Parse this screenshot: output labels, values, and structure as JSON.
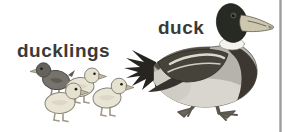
{
  "card": {
    "background": "#ffffff"
  },
  "labels": {
    "ducklings": "ducklings",
    "duck": "duck"
  },
  "colors": {
    "label_text": "#3a3a3a",
    "edge_bar": "#a0a0a0",
    "duck_head": "#262a22",
    "duck_chest": "#3c3831",
    "duck_belly": "#d8d6ce",
    "duck_wing": "#46433b",
    "duck_bill": "#cdc7b0",
    "duckling_light": "#e9e5d4",
    "duckling_dark": "#76736d"
  },
  "icons": {
    "duck_illustration": "mallard-duck-side-view",
    "ducklings_illustration": "four-ducklings-group"
  }
}
